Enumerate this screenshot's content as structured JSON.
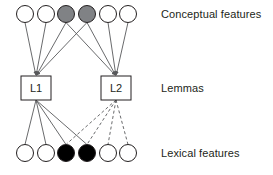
{
  "figure": {
    "type": "node-link-diagram",
    "background": "#ffffff",
    "line_color": "#58595b",
    "node_stroke": "#231f20",
    "width": 273,
    "height": 175
  },
  "layers": {
    "conceptual": {
      "label": "Conceptual features",
      "label_x": 161,
      "label_y": 8,
      "node_y": 14,
      "node_radius": 8.5,
      "nodes": [
        {
          "id": "c1",
          "cx": 25,
          "fill": "#ffffff",
          "state": "inactive"
        },
        {
          "id": "c2",
          "cx": 46,
          "fill": "#ffffff",
          "state": "inactive"
        },
        {
          "id": "c3",
          "cx": 66,
          "fill": "#808285",
          "state": "active-gray"
        },
        {
          "id": "c4",
          "cx": 87,
          "fill": "#808285",
          "state": "active-gray"
        },
        {
          "id": "c5",
          "cx": 108,
          "fill": "#ffffff",
          "state": "inactive"
        },
        {
          "id": "c6",
          "cx": 128,
          "fill": "#ffffff",
          "state": "inactive"
        }
      ]
    },
    "lemmas": {
      "label": "Lemmas",
      "label_x": 161,
      "label_y": 82,
      "box_y": 76,
      "box_w": 30,
      "box_h": 24,
      "nodes": [
        {
          "id": "L1",
          "text": "L1",
          "x": 21,
          "cx": 36,
          "cy": 88
        },
        {
          "id": "L2",
          "text": "L2",
          "x": 101,
          "cx": 116,
          "cy": 88
        }
      ]
    },
    "lexical": {
      "label": "Lexical features",
      "label_x": 161,
      "label_y": 147,
      "node_y": 153,
      "node_radius": 8.5,
      "nodes": [
        {
          "id": "x1",
          "cx": 25,
          "fill": "#ffffff",
          "state": "inactive"
        },
        {
          "id": "x2",
          "cx": 46,
          "fill": "#ffffff",
          "state": "inactive"
        },
        {
          "id": "x3",
          "cx": 66,
          "fill": "#000000",
          "state": "active-black"
        },
        {
          "id": "x4",
          "cx": 87,
          "fill": "#000000",
          "state": "active-black"
        },
        {
          "id": "x5",
          "cx": 108,
          "fill": "#ffffff",
          "state": "inactive"
        },
        {
          "id": "x6",
          "cx": 128,
          "fill": "#ffffff",
          "state": "inactive"
        }
      ]
    }
  },
  "edges": {
    "conceptual_to_lemma": [
      {
        "from": "c1",
        "to": "L1",
        "style": "solid",
        "arrow": true
      },
      {
        "from": "c2",
        "to": "L1",
        "style": "solid",
        "arrow": true
      },
      {
        "from": "c3",
        "to": "L1",
        "style": "solid",
        "arrow": true
      },
      {
        "from": "c4",
        "to": "L1",
        "style": "solid",
        "arrow": true
      },
      {
        "from": "c3",
        "to": "L2",
        "style": "solid",
        "arrow": true
      },
      {
        "from": "c4",
        "to": "L2",
        "style": "solid",
        "arrow": true
      },
      {
        "from": "c5",
        "to": "L2",
        "style": "solid",
        "arrow": true
      },
      {
        "from": "c6",
        "to": "L2",
        "style": "solid",
        "arrow": true
      }
    ],
    "lemma_to_lexical": [
      {
        "from": "L1",
        "to": "x1",
        "style": "solid",
        "arrow": false
      },
      {
        "from": "L1",
        "to": "x2",
        "style": "solid",
        "arrow": false
      },
      {
        "from": "L1",
        "to": "x3",
        "style": "solid",
        "arrow": false
      },
      {
        "from": "L1",
        "to": "x4",
        "style": "solid",
        "arrow": false
      },
      {
        "from": "L2",
        "to": "x3",
        "style": "dashed",
        "arrow": false
      },
      {
        "from": "L2",
        "to": "x4",
        "style": "dashed",
        "arrow": false
      },
      {
        "from": "L2",
        "to": "x5",
        "style": "dashed",
        "arrow": false
      },
      {
        "from": "L2",
        "to": "x6",
        "style": "dashed",
        "arrow": false
      }
    ]
  }
}
